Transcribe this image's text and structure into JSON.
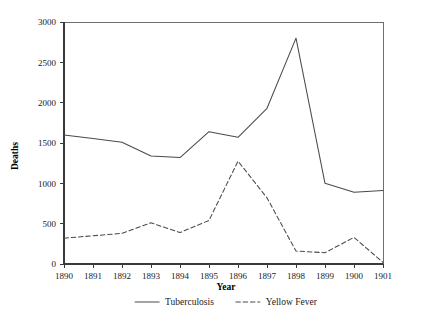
{
  "chart_data": {
    "type": "line",
    "title": "",
    "xlabel": "Year",
    "ylabel": "Deaths",
    "x": [
      1890,
      1891,
      1892,
      1893,
      1894,
      1895,
      1896,
      1897,
      1898,
      1899,
      1900,
      1901
    ],
    "categories": [
      "1890",
      "1891",
      "1892",
      "1893",
      "1894",
      "1895",
      "1896",
      "1897",
      "1898",
      "1899",
      "1900",
      "1901"
    ],
    "xlim": [
      1890,
      1901
    ],
    "ylim": [
      0,
      3000
    ],
    "yticks": [
      0,
      500,
      1000,
      1500,
      2000,
      2500,
      3000
    ],
    "ytick_labels": [
      "0",
      "500",
      "1000",
      "1500",
      "2000",
      "2500",
      "3000"
    ],
    "grid": false,
    "legend_position": "bottom",
    "series": [
      {
        "name": "Tuberculosis",
        "style": "solid",
        "color": "#4a4a4a",
        "values": [
          1600,
          1555,
          1510,
          1340,
          1320,
          1640,
          1570,
          1930,
          2800,
          1000,
          890,
          910
        ]
      },
      {
        "name": "Yellow Fever",
        "style": "dashed",
        "color": "#4a4a4a",
        "values": [
          320,
          350,
          380,
          510,
          390,
          540,
          1275,
          820,
          160,
          140,
          330,
          20
        ]
      }
    ]
  },
  "legend": {
    "items": [
      {
        "label": "Tuberculosis",
        "style": "solid"
      },
      {
        "label": "Yellow Fever",
        "style": "dashed"
      }
    ]
  }
}
